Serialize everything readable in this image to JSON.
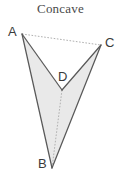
{
  "figure": {
    "title": "Concave",
    "kind": "concave-quadrilateral",
    "background_color": "#ffffff",
    "fill_color": "#e9e9e9",
    "solid_stroke_color": "#595959",
    "dotted_stroke_color": "#b0b0b0",
    "label_color": "#3b3b3b",
    "title_color": "#4a4a4a"
  },
  "vertices": [
    {
      "name": "A",
      "label": "A",
      "x": 22,
      "y": 34
    },
    {
      "name": "C",
      "label": "C",
      "x": 101,
      "y": 45
    },
    {
      "name": "D",
      "label": "D",
      "x": 62,
      "y": 90
    },
    {
      "name": "B",
      "label": "B",
      "x": 52,
      "y": 168
    }
  ],
  "edges": [
    {
      "name": "edge-A-C",
      "from": "A",
      "to": "C",
      "style": "dotted"
    },
    {
      "name": "edge-A-D",
      "from": "A",
      "to": "D",
      "style": "solid"
    },
    {
      "name": "edge-A-B",
      "from": "A",
      "to": "B",
      "style": "solid"
    },
    {
      "name": "edge-C-D",
      "from": "C",
      "to": "D",
      "style": "solid"
    },
    {
      "name": "edge-C-B",
      "from": "C",
      "to": "B",
      "style": "solid"
    },
    {
      "name": "edge-D-B",
      "from": "D",
      "to": "B",
      "style": "dotted"
    }
  ],
  "chart_data": {
    "type": "diagram",
    "title": "Concave",
    "shape": "quadrilateral ABCD with reflex interior angle at D",
    "points": {
      "A": [
        22,
        34
      ],
      "B": [
        52,
        168
      ],
      "C": [
        101,
        45
      ],
      "D": [
        62,
        90
      ]
    },
    "filled_polygon": [
      "A",
      "B",
      "C",
      "D"
    ],
    "reflex_vertex": "D",
    "dotted_segments": [
      [
        "A",
        "C"
      ],
      [
        "D",
        "B"
      ]
    ],
    "solid_segments": [
      [
        "A",
        "D"
      ],
      [
        "A",
        "B"
      ],
      [
        "C",
        "D"
      ],
      [
        "C",
        "B"
      ]
    ],
    "legend": [],
    "xlabel": "",
    "ylabel": ""
  }
}
